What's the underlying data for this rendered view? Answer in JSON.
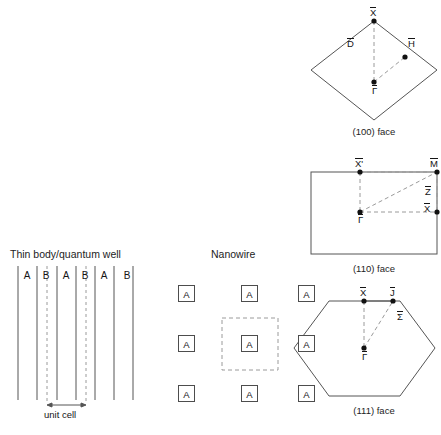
{
  "figure": {
    "background_color": "#ffffff",
    "line_color": "#555555",
    "dash_color": "#9a9a9a",
    "text_color": "#141414"
  },
  "panels": {
    "thin_body": {
      "title": "Thin body/quantum well",
      "layer_labels": [
        "A",
        "B",
        "A",
        "B",
        "A",
        "B"
      ],
      "unit_cell_label": "unit cell"
    },
    "nanowire": {
      "title": "Nanowire",
      "cell_letter": "A",
      "grid_rows": 3,
      "grid_cols": 3,
      "cells": [
        [
          "A",
          "A",
          "A"
        ],
        [
          "A",
          "A",
          "A"
        ],
        [
          "A",
          "A",
          "A"
        ]
      ]
    },
    "bz_100": {
      "caption": "(100) face",
      "shape": "diamond",
      "points": [
        {
          "label": "X",
          "bar": true,
          "position": "top"
        },
        {
          "label": "D",
          "bar": true,
          "position": "upper-left"
        },
        {
          "label": "H",
          "bar": true,
          "position": "upper-right"
        },
        {
          "label": "Γ",
          "bar": true,
          "position": "center"
        }
      ]
    },
    "bz_110": {
      "caption": "(110) face",
      "shape": "rectangle",
      "points": [
        {
          "label": "X'",
          "bar": true,
          "position": "top-mid"
        },
        {
          "label": "M",
          "bar": true,
          "position": "top-right"
        },
        {
          "label": "Z",
          "bar": true,
          "position": "right-mid"
        },
        {
          "label": "X",
          "bar": true,
          "position": "right-lower"
        },
        {
          "label": "Γ",
          "bar": true,
          "position": "center"
        }
      ]
    },
    "bz_111": {
      "caption": "(111) face",
      "shape": "hexagon",
      "points": [
        {
          "label": "X",
          "bar": true,
          "position": "top-mid"
        },
        {
          "label": "J",
          "bar": true,
          "position": "top-right"
        },
        {
          "label": "Σ",
          "bar": true,
          "position": "upper-right-edge"
        },
        {
          "label": "Γ",
          "bar": true,
          "position": "center"
        }
      ]
    }
  }
}
